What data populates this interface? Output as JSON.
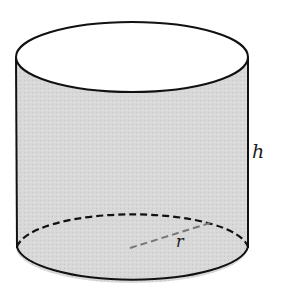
{
  "diagram": {
    "shape": "cylinder",
    "labels": {
      "height": "h",
      "radius": "r"
    },
    "colors": {
      "fill": "#d6d6d6",
      "top_fill": "#ffffff",
      "stroke": "#111111",
      "radius_line": "#777777"
    }
  }
}
